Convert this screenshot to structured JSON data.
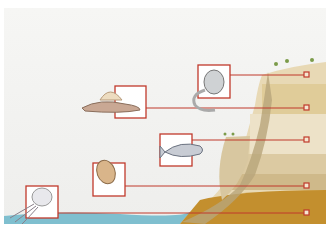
{
  "scene": {
    "description": "Geological cliff cross-section with fossil organisms linked to rock strata",
    "colors": {
      "box_border": "#c0392b",
      "water": "#7fbfcf",
      "strata_top": "#e8d9b5",
      "strata_mid": "#d9c496",
      "strata_low": "#c89a3a",
      "strata_base": "#b98626",
      "cliff_face": "#d8c7a0",
      "sky": "#f2f2f0"
    },
    "organisms": [
      {
        "name": "jellyfish",
        "box": [
          14,
          186,
          32,
          32
        ],
        "marker_y": 213
      },
      {
        "name": "trilobite",
        "box": [
          93,
          163,
          32,
          33
        ],
        "marker_y": 186
      },
      {
        "name": "fish",
        "box": [
          160,
          134,
          32,
          32
        ],
        "marker_y": 140
      },
      {
        "name": "dimetrodon",
        "box": [
          115,
          86,
          31,
          32
        ],
        "marker_y": 108
      },
      {
        "name": "primate",
        "box": [
          198,
          65,
          32,
          33
        ],
        "marker_y": 75
      }
    ]
  }
}
